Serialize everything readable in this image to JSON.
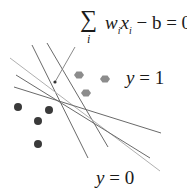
{
  "diagram": {
    "equation": {
      "sum_symbol": "∑",
      "index": "i",
      "w": "w",
      "x": "x",
      "sub": "i",
      "rest": " − b = 0"
    },
    "label_positive": {
      "var": "y",
      "rest": " = 1"
    },
    "label_negative": {
      "var": "y",
      "rest": " = 0"
    },
    "colors": {
      "line_dark": "#6a6a6a",
      "line_light": "#b0b0b0",
      "dot_dark": "#3a3a3a",
      "hex_gray": "#8c8c8c"
    },
    "lines": [
      {
        "x1": 32,
        "y1": 45,
        "x2": 88,
        "y2": 158,
        "tone": "dark"
      },
      {
        "x1": 47,
        "y1": 43,
        "x2": 108,
        "y2": 147,
        "tone": "dark"
      },
      {
        "x1": 10,
        "y1": 58,
        "x2": 160,
        "y2": 171,
        "tone": "light"
      },
      {
        "x1": 16,
        "y1": 75,
        "x2": 150,
        "y2": 158,
        "tone": "dark"
      },
      {
        "x1": 14,
        "y1": 87,
        "x2": 161,
        "y2": 133,
        "tone": "dark"
      }
    ],
    "arrow": {
      "x1": 75,
      "y1": 47,
      "x2": 55,
      "y2": 82
    },
    "class0_points": [
      [
        18,
        107
      ],
      [
        49,
        110
      ],
      [
        38,
        121
      ],
      [
        38,
        144
      ]
    ],
    "class1_points": [
      [
        79,
        75
      ],
      [
        105,
        79
      ],
      [
        86,
        93
      ]
    ]
  }
}
